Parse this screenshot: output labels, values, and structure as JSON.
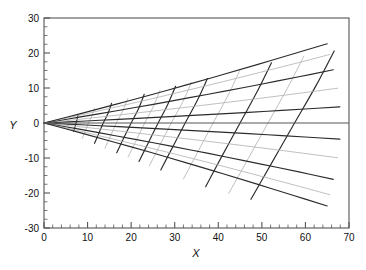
{
  "figure": {
    "title": "",
    "xlabel": "X",
    "ylabel": "Y"
  },
  "chart_data": {
    "type": "line",
    "title": "",
    "xlabel": "X",
    "ylabel": "Y",
    "xlim": [
      0,
      70
    ],
    "ylim": [
      -30,
      30
    ],
    "grid": false,
    "legend": null,
    "x_ticks": [
      0,
      10,
      20,
      30,
      40,
      50,
      60,
      70
    ],
    "y_ticks": [
      -30,
      -20,
      -10,
      0,
      10,
      20,
      30
    ],
    "x_minor_step": 2,
    "y_minor_step": 2.5,
    "axis_frame": true,
    "zero_line_y": 0,
    "colors": {
      "dark_curve": "#2b2b2b",
      "mid_curve": "#6b6b6b",
      "light_curve": "#b0b0b0",
      "axis": "#555555",
      "background": "#ffffff"
    },
    "series": [
      {
        "name": "trajectory-upper-1",
        "shade": "dark",
        "launch_angle_deg": 3.0,
        "points": [
          [
            0,
            0
          ],
          [
            8.6,
            0.51
          ],
          [
            17.1,
            1.04
          ],
          [
            25.7,
            1.59
          ],
          [
            34.2,
            2.16
          ],
          [
            42.8,
            2.75
          ],
          [
            51.3,
            3.36
          ],
          [
            59.9,
            3.99
          ],
          [
            67.9,
            4.62
          ]
        ]
      },
      {
        "name": "trajectory-upper-2",
        "shade": "light",
        "launch_angle_deg": 6.0,
        "points": [
          [
            0,
            0
          ],
          [
            8.5,
            1.11
          ],
          [
            17.0,
            2.26
          ],
          [
            25.4,
            3.45
          ],
          [
            33.9,
            4.68
          ],
          [
            42.4,
            5.95
          ],
          [
            50.9,
            7.26
          ],
          [
            59.3,
            8.61
          ],
          [
            67.4,
            9.94
          ]
        ]
      },
      {
        "name": "trajectory-upper-3",
        "shade": "dark",
        "launch_angle_deg": 9.0,
        "points": [
          [
            0,
            0
          ],
          [
            8.4,
            1.73
          ],
          [
            16.7,
            3.51
          ],
          [
            25.1,
            5.34
          ],
          [
            33.4,
            7.23
          ],
          [
            41.8,
            9.17
          ],
          [
            50.1,
            11.16
          ],
          [
            58.5,
            13.21
          ],
          [
            66.4,
            15.22
          ]
        ]
      },
      {
        "name": "trajectory-upper-4",
        "shade": "light",
        "launch_angle_deg": 11.5,
        "points": [
          [
            0,
            0
          ],
          [
            8.3,
            2.25
          ],
          [
            16.5,
            4.56
          ],
          [
            24.8,
            6.93
          ],
          [
            33.0,
            9.37
          ],
          [
            41.3,
            11.87
          ],
          [
            49.5,
            14.43
          ],
          [
            57.8,
            17.05
          ],
          [
            65.6,
            19.58
          ]
        ]
      },
      {
        "name": "trajectory-upper-5",
        "shade": "dark",
        "launch_angle_deg": 13.2,
        "points": [
          [
            0,
            0
          ],
          [
            8.2,
            2.62
          ],
          [
            16.4,
            5.31
          ],
          [
            24.6,
            8.06
          ],
          [
            32.7,
            10.89
          ],
          [
            40.9,
            13.78
          ],
          [
            49.1,
            16.75
          ],
          [
            57.3,
            19.78
          ],
          [
            65.0,
            22.63
          ]
        ]
      },
      {
        "name": "trajectory-lower-1",
        "shade": "dark",
        "launch_angle_deg": -3.0,
        "points": [
          [
            0,
            0
          ],
          [
            8.6,
            -0.51
          ],
          [
            17.1,
            -1.04
          ],
          [
            25.7,
            -1.59
          ],
          [
            34.2,
            -2.16
          ],
          [
            42.8,
            -2.75
          ],
          [
            51.3,
            -3.36
          ],
          [
            59.9,
            -3.99
          ],
          [
            67.9,
            -4.62
          ]
        ]
      },
      {
        "name": "trajectory-lower-2",
        "shade": "light",
        "launch_angle_deg": -6.0,
        "points": [
          [
            0,
            0
          ],
          [
            8.5,
            -1.11
          ],
          [
            17.0,
            -2.26
          ],
          [
            25.4,
            -3.45
          ],
          [
            33.9,
            -4.68
          ],
          [
            42.4,
            -5.95
          ],
          [
            50.9,
            -7.26
          ],
          [
            59.3,
            -8.61
          ],
          [
            67.4,
            -9.94
          ]
        ]
      },
      {
        "name": "trajectory-lower-3",
        "shade": "dark",
        "launch_angle_deg": -9.5,
        "points": [
          [
            0,
            0
          ],
          [
            8.4,
            -1.83
          ],
          [
            16.7,
            -3.71
          ],
          [
            25.1,
            -5.65
          ],
          [
            33.4,
            -7.64
          ],
          [
            41.8,
            -9.7
          ],
          [
            50.1,
            -11.81
          ],
          [
            58.5,
            -13.98
          ],
          [
            66.4,
            -16.1
          ]
        ]
      },
      {
        "name": "trajectory-lower-4",
        "shade": "light",
        "launch_angle_deg": -12.0,
        "points": [
          [
            0,
            0
          ],
          [
            8.3,
            -2.35
          ],
          [
            16.5,
            -4.77
          ],
          [
            24.8,
            -7.25
          ],
          [
            33.0,
            -9.8
          ],
          [
            41.3,
            -12.42
          ],
          [
            49.5,
            -15.1
          ],
          [
            57.8,
            -17.84
          ],
          [
            65.6,
            -20.49
          ]
        ]
      },
      {
        "name": "trajectory-lower-5",
        "shade": "dark",
        "launch_angle_deg": -13.8,
        "points": [
          [
            0,
            0
          ],
          [
            8.2,
            -2.74
          ],
          [
            16.4,
            -5.56
          ],
          [
            24.6,
            -8.44
          ],
          [
            32.7,
            -11.4
          ],
          [
            40.9,
            -14.43
          ],
          [
            49.1,
            -17.54
          ],
          [
            57.3,
            -20.71
          ],
          [
            65.0,
            -23.7
          ]
        ]
      },
      {
        "name": "isochrone-1",
        "shade": "dark",
        "x_at_axis": 7.3,
        "points": [
          [
            7.8,
            2.2
          ],
          [
            7.6,
            1.1
          ],
          [
            7.35,
            0.0
          ],
          [
            7.1,
            -1.2
          ],
          [
            6.8,
            -2.4
          ]
        ]
      },
      {
        "name": "isochrone-2",
        "shade": "light",
        "x_at_axis": 10.2,
        "points": [
          [
            11.6,
            4.2
          ],
          [
            11.0,
            2.1
          ],
          [
            10.2,
            0.0
          ],
          [
            9.5,
            -2.2
          ],
          [
            8.8,
            -4.4
          ]
        ]
      },
      {
        "name": "isochrone-3",
        "shade": "dark",
        "x_at_axis": 13.6,
        "points": [
          [
            15.5,
            5.6
          ],
          [
            14.7,
            2.8
          ],
          [
            13.6,
            0.0
          ],
          [
            12.6,
            -2.9
          ],
          [
            11.6,
            -5.8
          ]
        ]
      },
      {
        "name": "isochrone-4",
        "shade": "light",
        "x_at_axis": 16.6,
        "points": [
          [
            19.2,
            6.9
          ],
          [
            18.1,
            3.5
          ],
          [
            16.6,
            0.0
          ],
          [
            15.3,
            -3.6
          ],
          [
            14.0,
            -7.2
          ]
        ]
      },
      {
        "name": "isochrone-5",
        "shade": "dark",
        "x_at_axis": 20.0,
        "points": [
          [
            23.0,
            8.2
          ],
          [
            21.7,
            4.1
          ],
          [
            20.0,
            0.0
          ],
          [
            18.3,
            -4.3
          ],
          [
            16.7,
            -8.5
          ]
        ]
      },
      {
        "name": "isochrone-6",
        "shade": "light",
        "x_at_axis": 23.1,
        "points": [
          [
            26.6,
            9.3
          ],
          [
            25.1,
            4.7
          ],
          [
            23.1,
            0.0
          ],
          [
            21.2,
            -4.9
          ],
          [
            19.3,
            -9.7
          ]
        ]
      },
      {
        "name": "isochrone-7",
        "shade": "dark",
        "x_at_axis": 26.2,
        "points": [
          [
            30.2,
            10.5
          ],
          [
            28.4,
            5.3
          ],
          [
            26.2,
            0.0
          ],
          [
            24.0,
            -5.5
          ],
          [
            21.8,
            -11.0
          ]
        ]
      },
      {
        "name": "isochrone-8",
        "shade": "light",
        "x_at_axis": 29.2,
        "points": [
          [
            33.8,
            11.6
          ],
          [
            31.8,
            5.9
          ],
          [
            29.2,
            0.0
          ],
          [
            26.7,
            -6.1
          ],
          [
            24.2,
            -12.2
          ]
        ]
      },
      {
        "name": "isochrone-9",
        "shade": "dark",
        "x_at_axis": 32.4,
        "points": [
          [
            37.5,
            12.7
          ],
          [
            35.2,
            6.5
          ],
          [
            32.4,
            0.0
          ],
          [
            29.6,
            -6.7
          ],
          [
            26.8,
            -13.4
          ]
        ]
      },
      {
        "name": "isochrone-10",
        "shade": "light",
        "x_at_axis": 38.8,
        "points": [
          [
            45.0,
            15.2
          ],
          [
            42.2,
            7.8
          ],
          [
            38.8,
            0.0
          ],
          [
            35.4,
            -8.0
          ],
          [
            32.0,
            -16.0
          ]
        ]
      },
      {
        "name": "isochrone-11",
        "shade": "dark",
        "x_at_axis": 45.0,
        "points": [
          [
            52.2,
            17.2
          ],
          [
            48.9,
            8.9
          ],
          [
            45.0,
            0.0
          ],
          [
            41.0,
            -9.1
          ],
          [
            37.1,
            -18.2
          ]
        ]
      },
      {
        "name": "isochrone-12",
        "shade": "light",
        "x_at_axis": 51.4,
        "points": [
          [
            59.6,
            19.0
          ],
          [
            55.8,
            9.8
          ],
          [
            51.4,
            0.0
          ],
          [
            46.9,
            -10.1
          ],
          [
            42.4,
            -20.1
          ]
        ]
      },
      {
        "name": "isochrone-13",
        "shade": "dark",
        "x_at_axis": 57.5,
        "points": [
          [
            66.6,
            20.6
          ],
          [
            62.4,
            10.6
          ],
          [
            57.5,
            0.0
          ],
          [
            52.5,
            -10.9
          ],
          [
            47.5,
            -21.8
          ]
        ]
      }
    ],
    "notable_endpoints": {
      "upper_outer_curve_end": [
        67.0,
        20.5
      ],
      "lower_outer_curve_end": [
        67.0,
        -21.5
      ],
      "origin": [
        0,
        0
      ]
    }
  }
}
